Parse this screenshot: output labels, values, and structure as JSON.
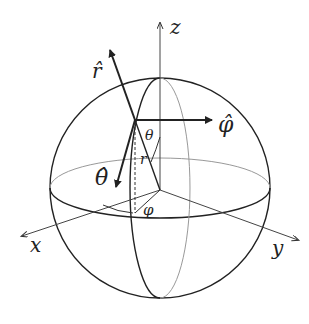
{
  "diagram": {
    "axes": {
      "x": "x",
      "y": "y",
      "z": "z"
    },
    "unit_vectors": {
      "r_hat": "r̂",
      "theta_hat": "θ̂",
      "phi_hat": "φ̂"
    },
    "angles": {
      "theta": "θ",
      "phi": "φ"
    },
    "radius_label": "r"
  }
}
